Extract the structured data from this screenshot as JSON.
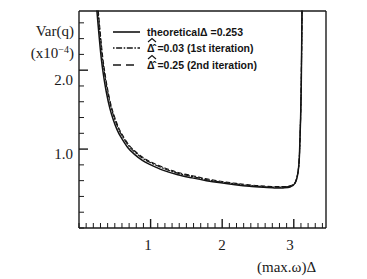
{
  "figure": {
    "background": "#ffffff",
    "ink_color": "#1a1a1a"
  },
  "axes": {
    "ylabel_line1": "Var(q)",
    "ylabel_line2_prefix": "(x10",
    "ylabel_line2_exponent": "−4",
    "ylabel_line2_suffix": ")",
    "xlabel": "(max.ω)Δ",
    "yticks": [
      "2.0",
      "1.0"
    ],
    "xticks": [
      "1",
      "2",
      "3"
    ]
  },
  "legend": {
    "entries": [
      {
        "style": "solid",
        "label": "theoreticalΔ =0.253"
      },
      {
        "style": "dashdot",
        "label": "Δ̂ =0.03  (1st iteration)"
      },
      {
        "style": "dashed",
        "label": "Δ̂ =0.25  (2nd iteration)"
      }
    ],
    "hat_symbol": "Δ"
  },
  "chart_data": {
    "type": "line",
    "title": "",
    "xlabel": "(max.ω)Δ",
    "ylabel": "Var(q) (x10^-4)",
    "xlim": [
      0,
      3.45
    ],
    "ylim": [
      0.0,
      2.75
    ],
    "xticks": [
      1,
      2,
      3
    ],
    "yticks": [
      1.0,
      2.0
    ],
    "grid": false,
    "legend_position": "top-center",
    "series": [
      {
        "name": "theoreticalΔ =0.253",
        "style": "solid",
        "x": [
          0.27,
          0.3,
          0.33,
          0.36,
          0.4,
          0.45,
          0.5,
          0.55,
          0.6,
          0.7,
          0.8,
          0.9,
          1.0,
          1.2,
          1.4,
          1.6,
          1.8,
          2.0,
          2.2,
          2.4,
          2.6,
          2.75,
          2.85,
          2.95,
          3.02,
          3.06,
          3.08,
          3.1,
          3.11,
          3.115
        ],
        "y": [
          2.75,
          2.45,
          2.18,
          1.98,
          1.76,
          1.55,
          1.4,
          1.28,
          1.19,
          1.05,
          0.96,
          0.89,
          0.84,
          0.76,
          0.7,
          0.66,
          0.62,
          0.59,
          0.565,
          0.545,
          0.53,
          0.525,
          0.525,
          0.535,
          0.58,
          0.72,
          0.95,
          1.6,
          2.3,
          2.75
        ]
      },
      {
        "name": "Δ̂ =0.03  (1st iteration)",
        "style": "dashdot",
        "x": [
          0.25,
          0.28,
          0.31,
          0.34,
          0.38,
          0.43,
          0.48,
          0.53,
          0.58,
          0.68,
          0.78,
          0.88,
          0.98,
          1.18,
          1.38,
          1.58,
          1.78,
          1.98,
          2.18,
          2.38,
          2.58,
          2.73,
          2.85,
          2.95,
          3.02,
          3.06,
          3.08,
          3.1,
          3.11,
          3.115
        ],
        "y": [
          2.75,
          2.44,
          2.16,
          1.95,
          1.73,
          1.52,
          1.37,
          1.25,
          1.16,
          1.02,
          0.93,
          0.86,
          0.81,
          0.73,
          0.675,
          0.635,
          0.6,
          0.572,
          0.548,
          0.528,
          0.515,
          0.508,
          0.508,
          0.52,
          0.57,
          0.71,
          0.94,
          1.58,
          2.28,
          2.75
        ]
      },
      {
        "name": "Δ̂ =0.25  (2nd iteration)",
        "style": "dashed",
        "x": [
          0.265,
          0.295,
          0.325,
          0.355,
          0.395,
          0.445,
          0.495,
          0.545,
          0.595,
          0.695,
          0.795,
          0.895,
          0.995,
          1.195,
          1.395,
          1.595,
          1.795,
          1.995,
          2.195,
          2.395,
          2.595,
          2.745,
          2.85,
          2.95,
          3.02,
          3.06,
          3.08,
          3.1,
          3.11,
          3.115
        ],
        "y": [
          2.75,
          2.445,
          2.17,
          1.97,
          1.75,
          1.54,
          1.39,
          1.27,
          1.18,
          1.04,
          0.95,
          0.88,
          0.83,
          0.75,
          0.69,
          0.65,
          0.61,
          0.582,
          0.558,
          0.538,
          0.523,
          0.518,
          0.518,
          0.53,
          0.575,
          0.715,
          0.945,
          1.59,
          2.29,
          2.75
        ]
      }
    ]
  }
}
